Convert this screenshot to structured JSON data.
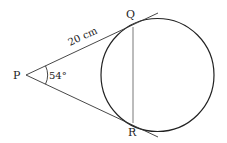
{
  "diagram": {
    "type": "geometry-tangents-to-circle",
    "points": {
      "P": {
        "label": "P",
        "x": 26,
        "y": 75
      },
      "Q": {
        "label": "Q",
        "x": 133,
        "y": 27
      },
      "R": {
        "label": "R",
        "x": 133,
        "y": 123
      }
    },
    "circle": {
      "cx": 157.5,
      "cy": 75,
      "r": 56.5
    },
    "labels": {
      "P": "P",
      "Q": "Q",
      "R": "R",
      "length_PQ": "20 cm",
      "angle_P": "54°"
    },
    "stroke_color": "#222222",
    "chord_color": "#555555"
  }
}
